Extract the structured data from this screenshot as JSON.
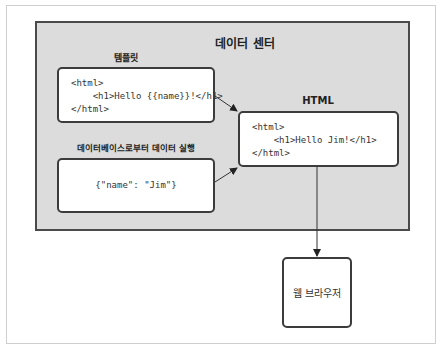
{
  "diagram": {
    "container_title": "데이터 센터",
    "template": {
      "label": "템플릿",
      "lines": [
        "<html>",
        "    <h1>Hello {{name}}!</h1>",
        "</html>"
      ]
    },
    "data": {
      "label": "데이터베이스로부터 데이터 실행",
      "content": "{\"name\": \"Jim\"}"
    },
    "html_output": {
      "label": "HTML",
      "lines": [
        "<html>",
        "    <h1>Hello Jim!</h1>",
        "</html>"
      ]
    },
    "browser": {
      "label": "웹 브라우저"
    },
    "edges": [
      {
        "from": "template",
        "to": "html_output"
      },
      {
        "from": "data",
        "to": "html_output"
      },
      {
        "from": "html_output",
        "to": "browser"
      }
    ],
    "colors": {
      "container_fill": "#dcdcdc",
      "border": "#3c3c3c",
      "box_fill": "#ffffff"
    }
  }
}
